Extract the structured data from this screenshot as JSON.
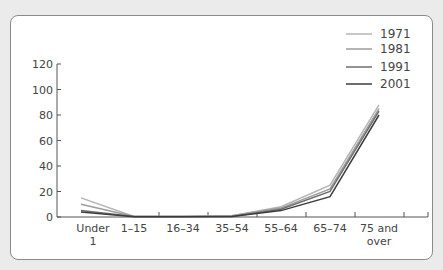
{
  "chart_data": {
    "type": "line",
    "title": "",
    "xlabel": "",
    "ylabel": "",
    "categories": [
      "Under 1",
      "1–15",
      "16–34",
      "35–54",
      "55–64",
      "65–74",
      "75 and over"
    ],
    "category_lines": [
      [
        "Under",
        "1"
      ],
      [
        "1–15"
      ],
      [
        "16–34"
      ],
      [
        "35–54"
      ],
      [
        "55–64"
      ],
      [
        "65–74"
      ],
      [
        "75 and",
        "over"
      ]
    ],
    "ylim": [
      0,
      120
    ],
    "yticks": [
      0,
      20,
      40,
      60,
      80,
      100,
      120
    ],
    "grid": false,
    "legend_position": "top-right",
    "series": [
      {
        "name": "1971",
        "color": "#b4b4b4",
        "values": [
          15,
          0.5,
          0.5,
          1,
          8,
          25,
          88
        ]
      },
      {
        "name": "1981",
        "color": "#9c9c9c",
        "values": [
          10,
          0.5,
          0.5,
          1,
          7,
          22,
          85
        ]
      },
      {
        "name": "1991",
        "color": "#6e6e6e",
        "values": [
          5,
          0.3,
          0.3,
          0.5,
          6,
          20,
          83
        ]
      },
      {
        "name": "2001",
        "color": "#3c3c3c",
        "values": [
          4,
          0.2,
          0.2,
          0.4,
          5,
          16,
          80
        ]
      }
    ]
  }
}
